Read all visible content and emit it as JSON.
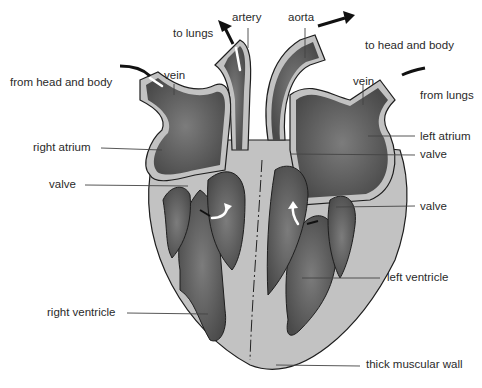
{
  "diagram": {
    "colors": {
      "wall": "#c2c2c2",
      "outline": "#1e1e1e",
      "chamber": "#5c5c5c",
      "chamber_light": "#7a7a7a",
      "arrow_black": "#111111",
      "arrow_white": "#ffffff",
      "label_text": "#2a2a2a",
      "leader": "#444444"
    },
    "labels": {
      "to_lungs": "to lungs",
      "artery": "artery",
      "aorta": "aorta",
      "to_head_and_body": "to head and body",
      "from_head_and_body": "from head and body",
      "vein_left": "vein",
      "vein_right": "vein",
      "from_lungs": "from lungs",
      "right_atrium": "right atrium",
      "left_atrium": "left atrium",
      "valve_top_right": "valve",
      "valve_left": "valve",
      "valve_right": "valve",
      "left_ventricle": "left ventricle",
      "right_ventricle": "right ventricle",
      "thick_muscular_wall": "thick muscular wall"
    }
  }
}
